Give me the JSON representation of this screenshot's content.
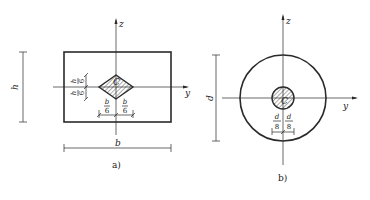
{
  "figure_a": {
    "caption": "a)",
    "axis_z_label": "z",
    "axis_y_label": "y",
    "width_label": "b",
    "height_label": "h",
    "kern_label": "C",
    "kern_half_height": {
      "numerator": "h",
      "denominator": "6"
    },
    "kern_half_width": {
      "numerator": "b",
      "denominator": "6"
    },
    "kern_shape": "rhombus"
  },
  "figure_b": {
    "caption": "b)",
    "axis_z_label": "z",
    "axis_y_label": "y",
    "diameter_label": "d",
    "kern_label": "C",
    "kern_radius": {
      "numerator": "d",
      "denominator": "8"
    },
    "kern_shape": "circle"
  }
}
